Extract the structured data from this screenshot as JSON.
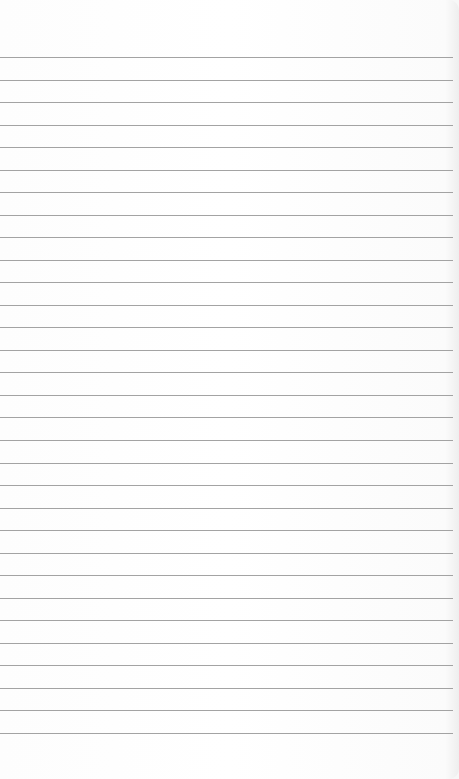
{
  "paper": {
    "type": "lined-sheet",
    "line_color": "#a3a3a3",
    "background": "#ffffff",
    "line_count": 31,
    "first_line_y": 57,
    "line_spacing": 22.53
  }
}
